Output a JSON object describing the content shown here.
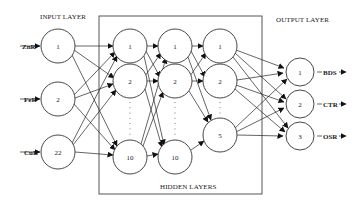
{
  "diagram": {
    "type": "neural-network",
    "labels": {
      "input_layer": "INPUT LAYER",
      "output_layer": "OUTPUT LAYER",
      "hidden_layers": "HIDDEN LAYERS"
    },
    "inputs": [
      {
        "name": "ZnR",
        "node": "1"
      },
      {
        "name": "FeR",
        "node": "2"
      },
      {
        "name": "CuR",
        "node": "22"
      }
    ],
    "hidden_layers": [
      {
        "nodes": [
          "1",
          "2",
          "10"
        ]
      },
      {
        "nodes": [
          "1",
          "2",
          "10"
        ]
      },
      {
        "nodes": [
          "1",
          "2",
          "5"
        ]
      }
    ],
    "outputs": [
      {
        "name": "BDS",
        "node": "1"
      },
      {
        "name": "CTR",
        "node": "2"
      },
      {
        "name": "OSR",
        "node": "3"
      }
    ]
  }
}
